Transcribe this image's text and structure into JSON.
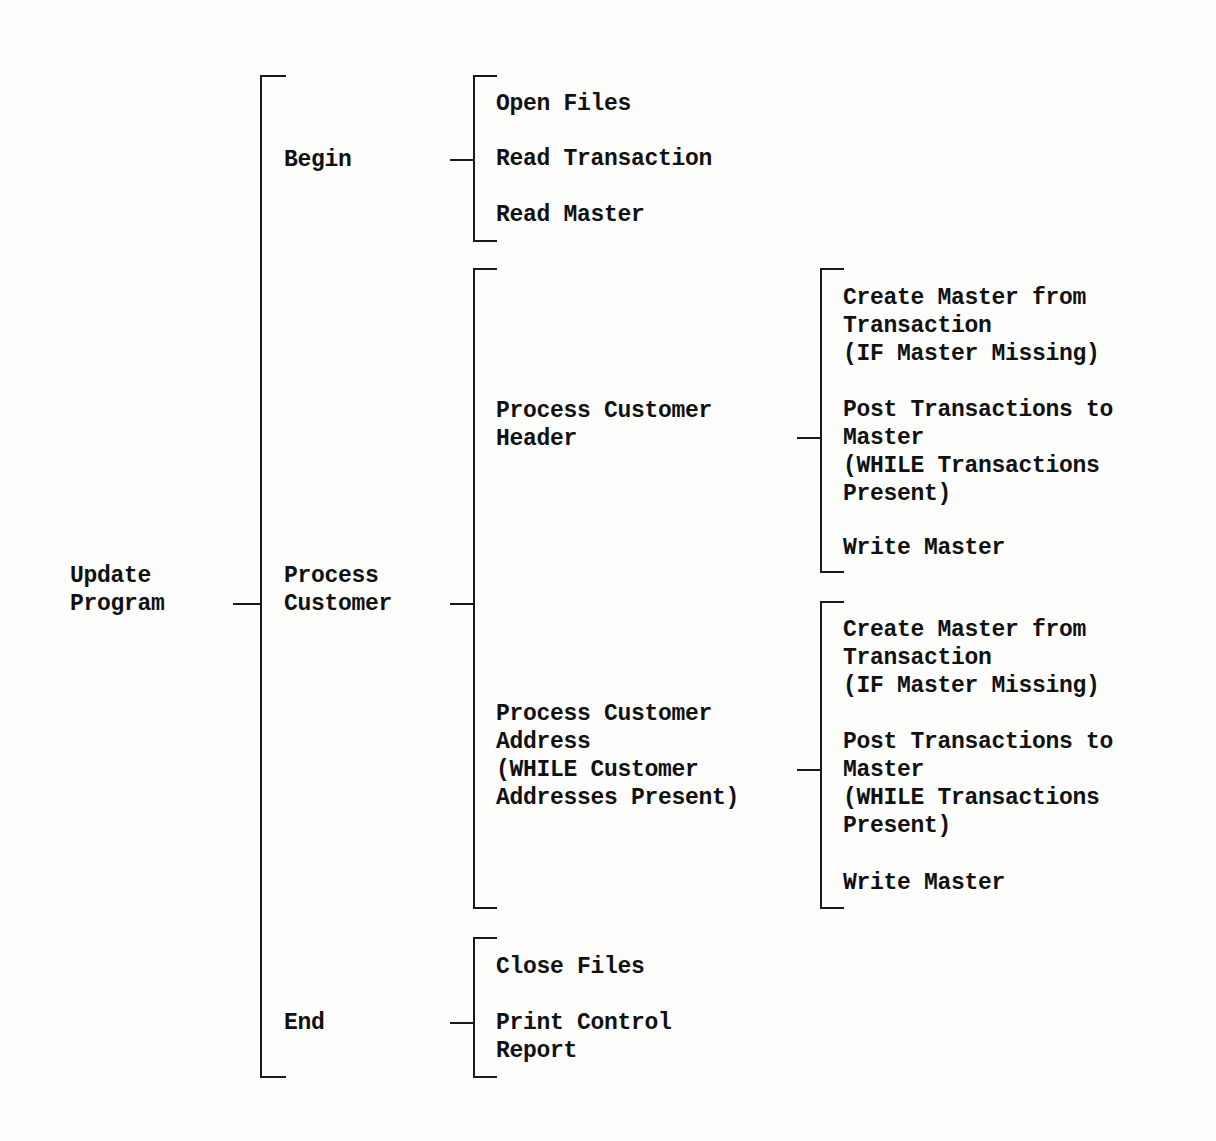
{
  "diagram": {
    "type": "warnier-orr",
    "root": {
      "label": "Update\nProgram",
      "children": [
        {
          "label": "Begin",
          "children": [
            {
              "label": "Open Files"
            },
            {
              "label": "Read Transaction"
            },
            {
              "label": "Read Master"
            }
          ]
        },
        {
          "label": "Process\nCustomer",
          "children": [
            {
              "label": "Process Customer\nHeader",
              "children": [
                {
                  "label": "Create Master from\nTransaction\n(IF Master Missing)"
                },
                {
                  "label": "Post Transactions to\nMaster\n(WHILE Transactions\nPresent)"
                },
                {
                  "label": "Write Master"
                }
              ]
            },
            {
              "label": "Process Customer\nAddress\n(WHILE Customer\nAddresses Present)",
              "children": [
                {
                  "label": "Create Master from\nTransaction\n(IF Master Missing)"
                },
                {
                  "label": "Post Transactions to\nMaster\n(WHILE Transactions\nPresent)"
                },
                {
                  "label": "Write Master"
                }
              ]
            }
          ]
        },
        {
          "label": "End",
          "children": [
            {
              "label": "Close Files"
            },
            {
              "label": "Print Control\nReport"
            }
          ]
        }
      ]
    }
  }
}
